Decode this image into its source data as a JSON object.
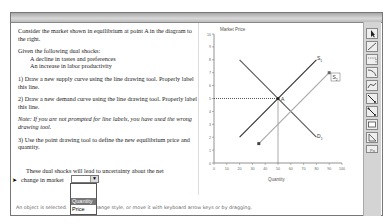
{
  "instructions": {
    "intro": "Consider the market shown in equilibrium at point A in the diagram to the right.",
    "shocks_title": "Given the following dual shocks:",
    "shocks": [
      "A decline in tastes and preferences",
      "An increase in labor productivity"
    ],
    "step1": "1) Draw a new supply curve using the line drawing tool. Properly label this line.",
    "step2": "2) Draw a new demand curve using the line drawing tool. Properly label this line.",
    "note": "Note: If you are not prompted for line labels, you have used the wrong drawing tool.",
    "step3": "3) Use the point drawing tool to define the new equilibrium price and quantity."
  },
  "question": {
    "line1": "These dual shocks will lead to uncertainty about the net",
    "line2": "change in market",
    "dropdown": {
      "selected": "",
      "options": [
        "",
        "Quantity",
        "Price"
      ],
      "highlighted": "Quantity"
    }
  },
  "status_bar": {
    "left": "An object is selected.",
    "right": "change style, or move it with keyboard arrow keys or by dragging."
  },
  "graph": {
    "y_label": "Market Price",
    "x_label": "Quantity",
    "y_ticks": [
      "0",
      "1",
      "2",
      "3",
      "4",
      "5",
      "6",
      "7",
      "8",
      "9",
      "10"
    ],
    "x_ticks": [
      "0",
      "10",
      "20",
      "30",
      "40",
      "50",
      "60",
      "70",
      "80",
      "90",
      "100"
    ],
    "curves": [
      {
        "label": "S1",
        "from": [
          20,
          2
        ],
        "to": [
          80,
          8
        ],
        "color": "#333333"
      },
      {
        "label": "D1",
        "from": [
          20,
          8
        ],
        "to": [
          80,
          2
        ],
        "color": "#555555"
      },
      {
        "label": "S2",
        "from": [
          35,
          1.5
        ],
        "to": [
          90,
          7
        ],
        "color": "#aaaaaa"
      }
    ],
    "equilibrium": {
      "label": "A",
      "x": 50,
      "y": 5
    }
  },
  "toolbar": {
    "tools": [
      "select-tool",
      "line-tool",
      "dashed-line-tool",
      "curve-tool",
      "s-curve-tool",
      "point-line-tool",
      "point-line-tool-2",
      "rectangle-tool",
      "polygon-tool",
      "more-tool"
    ]
  }
}
